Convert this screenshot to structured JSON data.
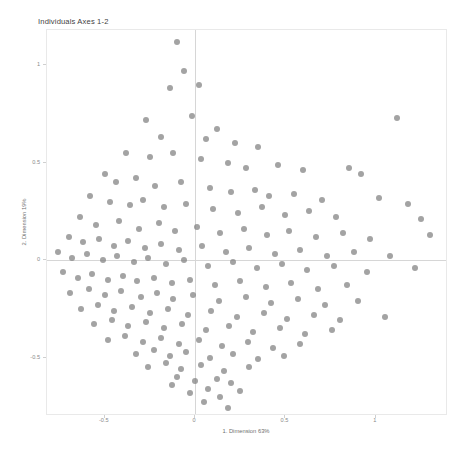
{
  "chart_data": {
    "type": "scatter",
    "title": "Individuals Axes 1-2",
    "xlabel": "1. Dimension 63%",
    "ylabel": "2. Dimension 19%",
    "grid": false,
    "legend": null,
    "xlim": [
      -0.82,
      1.4
    ],
    "ylim": [
      -0.8,
      1.18
    ],
    "xticks": [
      -0.5,
      0,
      0.5,
      1
    ],
    "xticklabels": [
      "-0.5",
      "0",
      "0.5",
      "1"
    ],
    "yticks": [
      -0.5,
      0,
      0.5,
      1
    ],
    "yticklabels": [
      "-0.5",
      "0",
      "0.5",
      "1"
    ],
    "reference_lines": {
      "vertical_at": 0,
      "horizontal_at": 0
    },
    "marker": {
      "shape": "circle",
      "color": "#808080",
      "opacity": 0.72,
      "size_px": 6
    },
    "n_points": 186,
    "points": [
      [
        -0.1,
        1.12
      ],
      [
        -0.06,
        0.97
      ],
      [
        -0.14,
        0.88
      ],
      [
        0.02,
        0.9
      ],
      [
        -0.27,
        0.72
      ],
      [
        -0.02,
        0.74
      ],
      [
        1.12,
        0.73
      ],
      [
        0.12,
        0.67
      ],
      [
        -0.19,
        0.63
      ],
      [
        0.06,
        0.62
      ],
      [
        0.22,
        0.6
      ],
      [
        0.35,
        0.58
      ],
      [
        -0.38,
        0.55
      ],
      [
        -0.25,
        0.53
      ],
      [
        -0.12,
        0.55
      ],
      [
        0.03,
        0.52
      ],
      [
        0.18,
        0.5
      ],
      [
        0.28,
        0.47
      ],
      [
        0.46,
        0.49
      ],
      [
        0.6,
        0.46
      ],
      [
        0.85,
        0.47
      ],
      [
        0.92,
        0.44
      ],
      [
        -0.5,
        0.44
      ],
      [
        -0.44,
        0.4
      ],
      [
        -0.33,
        0.42
      ],
      [
        -0.22,
        0.38
      ],
      [
        -0.08,
        0.4
      ],
      [
        0.08,
        0.37
      ],
      [
        0.2,
        0.35
      ],
      [
        0.33,
        0.36
      ],
      [
        0.41,
        0.33
      ],
      [
        0.55,
        0.34
      ],
      [
        0.7,
        0.31
      ],
      [
        1.02,
        0.32
      ],
      [
        1.18,
        0.29
      ],
      [
        -0.58,
        0.33
      ],
      [
        -0.47,
        0.3
      ],
      [
        -0.36,
        0.28
      ],
      [
        -0.29,
        0.31
      ],
      [
        -0.17,
        0.27
      ],
      [
        -0.05,
        0.29
      ],
      [
        0.1,
        0.26
      ],
      [
        0.24,
        0.24
      ],
      [
        0.37,
        0.27
      ],
      [
        0.5,
        0.23
      ],
      [
        0.63,
        0.25
      ],
      [
        0.78,
        0.22
      ],
      [
        1.25,
        0.21
      ],
      [
        -0.64,
        0.22
      ],
      [
        -0.55,
        0.18
      ],
      [
        -0.42,
        0.2
      ],
      [
        -0.31,
        0.16
      ],
      [
        -0.2,
        0.19
      ],
      [
        -0.11,
        0.15
      ],
      [
        0.01,
        0.17
      ],
      [
        0.14,
        0.14
      ],
      [
        0.27,
        0.16
      ],
      [
        0.4,
        0.13
      ],
      [
        0.52,
        0.15
      ],
      [
        0.67,
        0.12
      ],
      [
        0.82,
        0.14
      ],
      [
        0.97,
        0.11
      ],
      [
        1.3,
        0.13
      ],
      [
        -0.7,
        0.12
      ],
      [
        -0.62,
        0.09
      ],
      [
        -0.53,
        0.11
      ],
      [
        -0.45,
        0.07
      ],
      [
        -0.37,
        0.1
      ],
      [
        -0.28,
        0.06
      ],
      [
        -0.19,
        0.08
      ],
      [
        -0.09,
        0.05
      ],
      [
        0.04,
        0.07
      ],
      [
        0.17,
        0.04
      ],
      [
        0.3,
        0.06
      ],
      [
        0.44,
        0.03
      ],
      [
        0.58,
        0.05
      ],
      [
        0.73,
        0.02
      ],
      [
        0.88,
        0.04
      ],
      [
        1.08,
        0.02
      ],
      [
        -0.76,
        0.04
      ],
      [
        -0.68,
        0.01
      ],
      [
        -0.6,
        0.03
      ],
      [
        -0.51,
        0.0
      ],
      [
        -0.43,
        0.02
      ],
      [
        -0.34,
        -0.01
      ],
      [
        -0.26,
        0.01
      ],
      [
        -0.16,
        -0.02
      ],
      [
        -0.06,
        0.0
      ],
      [
        0.07,
        -0.03
      ],
      [
        0.21,
        -0.01
      ],
      [
        0.34,
        -0.04
      ],
      [
        0.48,
        -0.02
      ],
      [
        0.62,
        -0.05
      ],
      [
        0.77,
        -0.03
      ],
      [
        0.95,
        -0.06
      ],
      [
        1.22,
        -0.04
      ],
      [
        -0.73,
        -0.06
      ],
      [
        -0.65,
        -0.09
      ],
      [
        -0.57,
        -0.07
      ],
      [
        -0.48,
        -0.1
      ],
      [
        -0.4,
        -0.08
      ],
      [
        -0.32,
        -0.11
      ],
      [
        -0.23,
        -0.09
      ],
      [
        -0.13,
        -0.12
      ],
      [
        -0.03,
        -0.1
      ],
      [
        0.11,
        -0.13
      ],
      [
        0.25,
        -0.11
      ],
      [
        0.39,
        -0.14
      ],
      [
        0.53,
        -0.12
      ],
      [
        0.68,
        -0.15
      ],
      [
        0.84,
        -0.13
      ],
      [
        -0.69,
        -0.17
      ],
      [
        -0.59,
        -0.15
      ],
      [
        -0.5,
        -0.18
      ],
      [
        -0.41,
        -0.16
      ],
      [
        -0.3,
        -0.19
      ],
      [
        -0.21,
        -0.17
      ],
      [
        -0.12,
        -0.2
      ],
      [
        -0.01,
        -0.18
      ],
      [
        0.13,
        -0.21
      ],
      [
        0.28,
        -0.19
      ],
      [
        0.42,
        -0.22
      ],
      [
        0.57,
        -0.2
      ],
      [
        0.72,
        -0.23
      ],
      [
        0.9,
        -0.21
      ],
      [
        -0.63,
        -0.25
      ],
      [
        -0.54,
        -0.23
      ],
      [
        -0.45,
        -0.26
      ],
      [
        -0.35,
        -0.24
      ],
      [
        -0.25,
        -0.27
      ],
      [
        -0.15,
        -0.25
      ],
      [
        -0.04,
        -0.28
      ],
      [
        0.09,
        -0.26
      ],
      [
        0.23,
        -0.29
      ],
      [
        0.38,
        -0.27
      ],
      [
        0.51,
        -0.3
      ],
      [
        0.66,
        -0.28
      ],
      [
        0.8,
        -0.31
      ],
      [
        1.05,
        -0.29
      ],
      [
        -0.56,
        -0.33
      ],
      [
        -0.46,
        -0.31
      ],
      [
        -0.37,
        -0.34
      ],
      [
        -0.27,
        -0.32
      ],
      [
        -0.17,
        -0.35
      ],
      [
        -0.07,
        -0.33
      ],
      [
        0.06,
        -0.36
      ],
      [
        0.19,
        -0.34
      ],
      [
        0.32,
        -0.37
      ],
      [
        0.47,
        -0.35
      ],
      [
        0.61,
        -0.38
      ],
      [
        0.76,
        -0.36
      ],
      [
        -0.48,
        -0.41
      ],
      [
        -0.39,
        -0.39
      ],
      [
        -0.29,
        -0.42
      ],
      [
        -0.19,
        -0.4
      ],
      [
        -0.09,
        -0.43
      ],
      [
        0.02,
        -0.41
      ],
      [
        0.15,
        -0.44
      ],
      [
        0.29,
        -0.42
      ],
      [
        0.43,
        -0.45
      ],
      [
        0.58,
        -0.43
      ],
      [
        -0.33,
        -0.48
      ],
      [
        -0.23,
        -0.46
      ],
      [
        -0.14,
        -0.49
      ],
      [
        -0.05,
        -0.47
      ],
      [
        0.08,
        -0.5
      ],
      [
        0.21,
        -0.48
      ],
      [
        0.35,
        -0.51
      ],
      [
        0.49,
        -0.49
      ],
      [
        -0.26,
        -0.55
      ],
      [
        -0.16,
        -0.53
      ],
      [
        -0.08,
        -0.56
      ],
      [
        0.03,
        -0.54
      ],
      [
        0.16,
        -0.57
      ],
      [
        0.3,
        -0.55
      ],
      [
        0.12,
        -0.61
      ],
      [
        0.0,
        -0.62
      ],
      [
        -0.1,
        -0.6
      ],
      [
        0.2,
        -0.63
      ],
      [
        0.07,
        -0.66
      ],
      [
        -0.03,
        -0.68
      ],
      [
        0.14,
        -0.7
      ],
      [
        0.05,
        -0.73
      ],
      [
        -0.13,
        -0.64
      ],
      [
        0.25,
        -0.67
      ],
      [
        0.18,
        -0.76
      ]
    ]
  }
}
